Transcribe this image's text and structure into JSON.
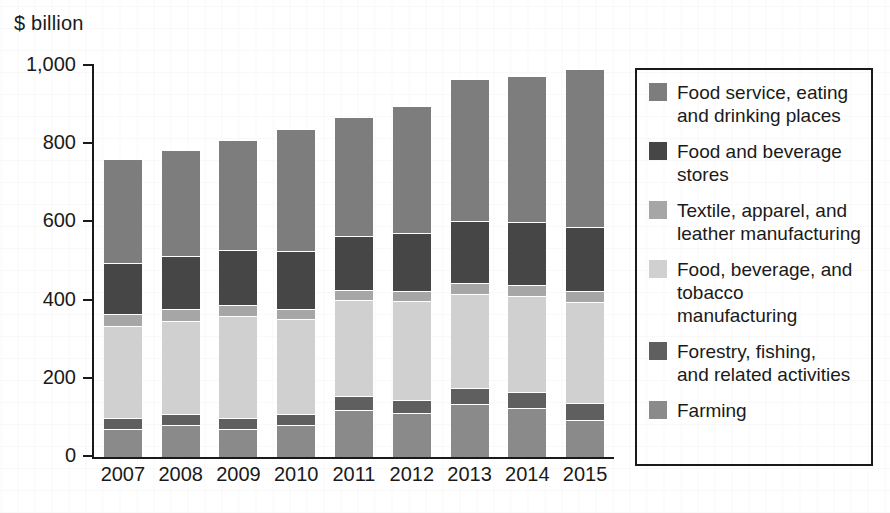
{
  "axis_unit_label": "$ billion",
  "legend": {
    "items": [
      {
        "label": "Food service, eating\nand drinking places",
        "color": "#7d7d7d",
        "swatch_name": "legend-swatch-food-service"
      },
      {
        "label": "Food and beverage\nstores",
        "color": "#464646",
        "swatch_name": "legend-swatch-food-beverage-stores"
      },
      {
        "label": "Textile, apparel, and\nleather manufacturing",
        "color": "#a6a6a6",
        "swatch_name": "legend-swatch-textile"
      },
      {
        "label": "Food, beverage, and\ntobacco manufacturing",
        "color": "#d0d0d0",
        "swatch_name": "legend-swatch-food-bev-tobacco"
      },
      {
        "label": "Forestry, fishing,\nand related activities",
        "color": "#5f5f5f",
        "swatch_name": "legend-swatch-forestry"
      },
      {
        "label": "Farming",
        "color": "#8a8a8a",
        "swatch_name": "legend-swatch-farming"
      }
    ]
  },
  "chart_data": {
    "type": "bar",
    "stacked": true,
    "title": "",
    "xlabel": "",
    "ylabel": "$ billion",
    "ylim": [
      0,
      1000
    ],
    "yticks": [
      0,
      200,
      400,
      600,
      800,
      1000
    ],
    "ytick_labels": [
      "0",
      "200",
      "400",
      "600",
      "800",
      "1,000"
    ],
    "grid": false,
    "legend_position": "right",
    "categories": [
      "2007",
      "2008",
      "2009",
      "2010",
      "2011",
      "2012",
      "2013",
      "2014",
      "2015"
    ],
    "series": [
      {
        "name": "Farming",
        "color": "#8a8a8a",
        "values": [
          71,
          81,
          72,
          83,
          119,
          112,
          136,
          126,
          95
        ]
      },
      {
        "name": "Forestry, fishing, and related activities",
        "color": "#5f5f5f",
        "values": [
          29,
          28,
          28,
          28,
          38,
          35,
          41,
          40,
          43
        ]
      },
      {
        "name": "Food, beverage, and tobacco manufacturing",
        "color": "#d0d0d0",
        "values": [
          234,
          239,
          261,
          242,
          244,
          253,
          240,
          245,
          259
        ]
      },
      {
        "name": "Textile, apparel, and leather manufacturing",
        "color": "#a6a6a6",
        "values": [
          31,
          30,
          28,
          26,
          26,
          25,
          29,
          30,
          28
        ]
      },
      {
        "name": "Food and beverage stores",
        "color": "#464646",
        "values": [
          131,
          135,
          140,
          149,
          139,
          148,
          157,
          160,
          164
        ]
      },
      {
        "name": "Food service, eating and drinking places",
        "color": "#7d7d7d",
        "values": [
          266,
          273,
          283,
          310,
          303,
          324,
          364,
          373,
          404
        ]
      }
    ],
    "totals": [
      762,
      786,
      812,
      838,
      869,
      897,
      967,
      974,
      993
    ]
  }
}
